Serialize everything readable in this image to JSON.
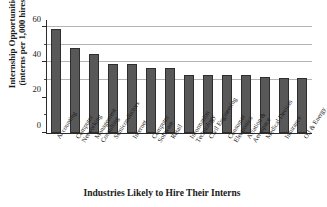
{
  "chart_data": {
    "type": "bar",
    "title": "",
    "xlabel": "Industries Likely to Hire Their Interns",
    "ylabel_line1": "Internship Opportunities",
    "ylabel_line2": "(interns per 1,000 hires)",
    "categories": [
      "Accounting",
      "Computer Networking",
      "Management Consulting",
      "Semiconductors",
      "Internet",
      "Computer Software",
      "Retail",
      "Information Technology",
      "Civil Engineering",
      "Consumer Electronics",
      "Aviation & Aerospace",
      "Medical Devices",
      "Insurance",
      "Oil & Energy"
    ],
    "category_lines": [
      [
        "Accounting"
      ],
      [
        "Computer",
        "Networking"
      ],
      [
        "Management",
        "Consulting"
      ],
      [
        "Semiconductors"
      ],
      [
        "Internet"
      ],
      [
        "Computer",
        "Software"
      ],
      [
        "Retail"
      ],
      [
        "Information",
        "Technology"
      ],
      [
        "Civil Engineering"
      ],
      [
        "Consumer",
        "Electronics"
      ],
      [
        "Aviation &",
        "Aerospace"
      ],
      [
        "Medical Devices"
      ],
      [
        "Insurance"
      ],
      [
        "Oil & Energy"
      ]
    ],
    "values": [
      59,
      48,
      45,
      39,
      39,
      37,
      37,
      33,
      33,
      33,
      33,
      32,
      31,
      31
    ],
    "ylim": [
      0,
      64
    ],
    "yticks": [
      0,
      20,
      40,
      60
    ],
    "yticks_minor": [
      10,
      30,
      50
    ],
    "gridlines": [
      30,
      40,
      50,
      60
    ],
    "grid": true,
    "legend": "none",
    "bar_color": "#585858",
    "bar_edge_color": "#2e2e2e",
    "grid_color": "#b4b4b4",
    "axis_color": "#2b2b2b"
  }
}
